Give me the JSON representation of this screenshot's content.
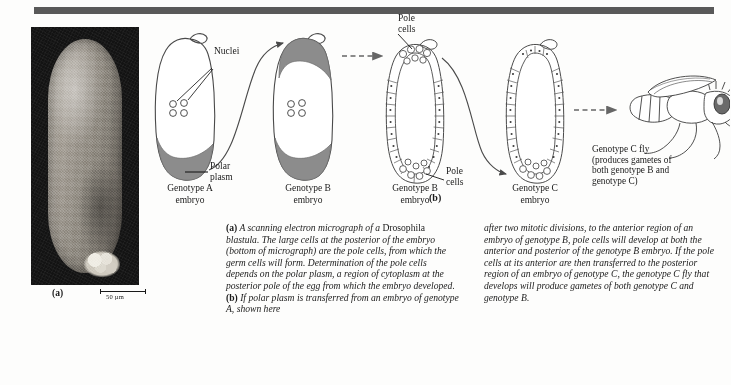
{
  "figure": {
    "panel_a_label": "(a)",
    "panel_b_label": "(b)",
    "scalebar_text": "50 µm"
  },
  "diagram": {
    "labels": {
      "nuclei": "Nuclei",
      "polar_plasm": "Polar\nplasm",
      "pole_cells_top": "Pole\ncells",
      "pole_cells_bottom": "Pole\ncells"
    },
    "embryos": [
      {
        "id": "embryo-genotype-a",
        "caption": "Genotype A\nembryo"
      },
      {
        "id": "embryo-genotype-b",
        "caption": "Genotype B\nembryo"
      },
      {
        "id": "embryo-genotype-b-blastoderm",
        "caption": "Genotype B\nembryo"
      },
      {
        "id": "embryo-genotype-c-blastoderm",
        "caption": "Genotype C\nembryo"
      }
    ],
    "fly": {
      "caption": "Genotype C fly\n(produces gametes of\nboth genotype B and\ngenotype C)"
    }
  },
  "caption": {
    "column_left_a_marker": "(a)",
    "column_left_part1": " A scanning electron micrograph of a ",
    "column_left_drosophila": "Drosophila",
    "column_left_part2": " blastula. The large cells at the posterior of the embryo (bottom of micrograph) are the pole cells, from which the germ cells will form. Determination of the pole cells depends on the polar plasm, a region of cytoplasm at the posterior pole of the egg from which the embryo developed. ",
    "column_left_b_marker": "(b)",
    "column_left_part3": " If polar plasm is transferred from an embryo of genotype A, shown here",
    "column_right": "after two mitotic divisions, to the anterior region of an embryo of genotype B, pole cells will develop at both the anterior and posterior of the genotype B embryo. If the pole cells at its anterior are then transferred to the posterior region of an embryo of genotype C, the genotype C fly that develops will produce gametes of both genotype C and genotype B."
  },
  "colors": {
    "rule": "#595959",
    "polar_plasm": "#8c8c8c",
    "ink": "#1a1a1a",
    "micrograph_bg": "#0d0d0d"
  }
}
